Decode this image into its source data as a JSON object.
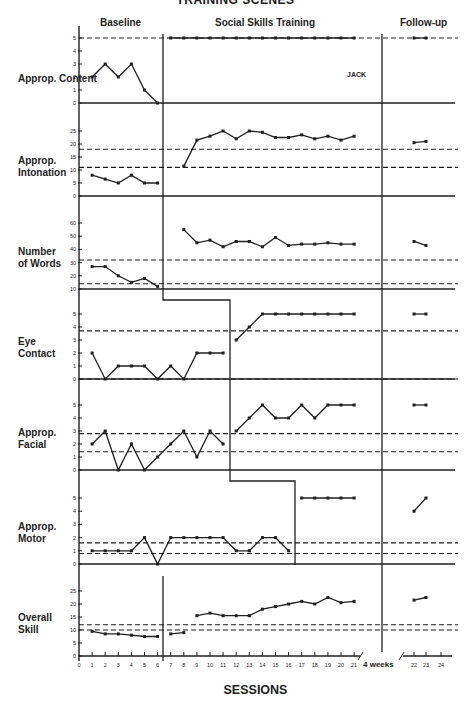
{
  "figure": {
    "title": "TRAINING SCENES",
    "subject": "JACK",
    "phases": [
      "Baseline",
      "Social Skills Training",
      "Follow-up"
    ],
    "x_axis_label": "SESSIONS",
    "gap_label": "4 weeks"
  },
  "chart_data": [
    {
      "type": "line",
      "title": "Approp. Content",
      "ylabel": "Approp. Content",
      "yticks": [
        0,
        1,
        2,
        3,
        4,
        5
      ],
      "ylim": [
        0,
        5
      ],
      "reference_lines": [
        5
      ],
      "phase_change_after_session": 6,
      "series": [
        {
          "name": "Baseline",
          "x": [
            1,
            2,
            3,
            4,
            5,
            6
          ],
          "values": [
            2,
            3,
            2,
            3,
            1,
            0
          ]
        },
        {
          "name": "Training",
          "x": [
            7,
            8,
            9,
            10,
            11,
            12,
            13,
            14,
            15,
            16,
            17,
            18,
            19,
            20,
            21
          ],
          "values": [
            5,
            5,
            5,
            5,
            5,
            5,
            5,
            5,
            5,
            5,
            5,
            5,
            5,
            5,
            5
          ]
        },
        {
          "name": "Follow-up",
          "x": [
            22,
            23
          ],
          "values": [
            5,
            5
          ]
        }
      ]
    },
    {
      "type": "line",
      "title": "Approp. Intonation",
      "ylabel": "Approp. Intonation",
      "yticks": [
        0,
        5,
        10,
        15,
        20,
        25
      ],
      "ylim": [
        0,
        25
      ],
      "reference_lines": [
        11,
        18
      ],
      "phase_change_after_session": 6,
      "series": [
        {
          "name": "Baseline",
          "x": [
            1,
            2,
            3,
            4,
            5,
            6
          ],
          "values": [
            8,
            6.5,
            5,
            8,
            5,
            5
          ]
        },
        {
          "name": "Training",
          "x": [
            8,
            9,
            10,
            11,
            12,
            13,
            14,
            15,
            16,
            17,
            18,
            19,
            20,
            21
          ],
          "values": [
            11.5,
            21.5,
            23,
            25,
            22,
            25,
            24.5,
            22.5,
            22.5,
            23.5,
            22,
            23,
            21.5,
            23
          ]
        },
        {
          "name": "Follow-up",
          "x": [
            22,
            23
          ],
          "values": [
            20.5,
            21
          ]
        }
      ]
    },
    {
      "type": "line",
      "title": "Number of Words",
      "ylabel": "Number of Words",
      "yticks": [
        10,
        20,
        30,
        40,
        50,
        60
      ],
      "ylim": [
        10,
        60
      ],
      "reference_lines": [
        14,
        32
      ],
      "phase_change_after_session": 6,
      "series": [
        {
          "name": "Baseline",
          "x": [
            1,
            2,
            3,
            4,
            5,
            6
          ],
          "values": [
            27,
            27,
            20,
            15,
            18,
            12
          ]
        },
        {
          "name": "Training",
          "x": [
            8,
            9,
            10,
            11,
            12,
            13,
            14,
            15,
            16,
            17,
            18,
            19,
            20,
            21
          ],
          "values": [
            55,
            45,
            47,
            42,
            46,
            46,
            42,
            49,
            43,
            44,
            44,
            45,
            44,
            44
          ]
        },
        {
          "name": "Follow-up",
          "x": [
            22,
            23
          ],
          "values": [
            46,
            43
          ]
        }
      ]
    },
    {
      "type": "line",
      "title": "Eye Contact",
      "ylabel": "Eye Contact",
      "yticks": [
        0,
        1,
        2,
        3,
        4,
        5
      ],
      "ylim": [
        0,
        5
      ],
      "reference_lines": [
        0,
        3.7
      ],
      "phase_change_after_session": 11,
      "series": [
        {
          "name": "Baseline",
          "x": [
            1,
            2,
            3,
            4,
            5,
            6,
            7,
            8,
            9,
            10,
            11
          ],
          "values": [
            2,
            0,
            1,
            1,
            1,
            0,
            1,
            0,
            2,
            2,
            2
          ]
        },
        {
          "name": "Training",
          "x": [
            12,
            13,
            14,
            15,
            16,
            17,
            18,
            19,
            20,
            21
          ],
          "values": [
            3,
            4,
            5,
            5,
            5,
            5,
            5,
            5,
            5,
            5
          ]
        },
        {
          "name": "Follow-up",
          "x": [
            22,
            23
          ],
          "values": [
            5,
            5
          ]
        }
      ]
    },
    {
      "type": "line",
      "title": "Approp. Facial",
      "ylabel": "Approp. Facial",
      "yticks": [
        0,
        1,
        2,
        3,
        4,
        5
      ],
      "ylim": [
        0,
        5
      ],
      "reference_lines": [
        1.4,
        2.8
      ],
      "phase_change_after_session": 11,
      "series": [
        {
          "name": "Baseline",
          "x": [
            1,
            2,
            3,
            4,
            5,
            6,
            7,
            8,
            9,
            10,
            11
          ],
          "values": [
            2,
            3,
            0,
            2,
            0,
            1,
            2,
            3,
            1,
            3,
            2
          ]
        },
        {
          "name": "Training",
          "x": [
            12,
            13,
            14,
            15,
            16,
            17,
            18,
            19,
            20,
            21
          ],
          "values": [
            3,
            4,
            5,
            4,
            4,
            5,
            4,
            5,
            5,
            5
          ]
        },
        {
          "name": "Follow-up",
          "x": [
            22,
            23
          ],
          "values": [
            5,
            5
          ]
        }
      ]
    },
    {
      "type": "line",
      "title": "Approp. Motor",
      "ylabel": "Approp. Motor",
      "yticks": [
        0,
        1,
        2,
        3,
        4,
        5
      ],
      "ylim": [
        0,
        5
      ],
      "reference_lines": [
        0.8,
        1.6
      ],
      "phase_change_after_session": 16,
      "series": [
        {
          "name": "Baseline",
          "x": [
            1,
            2,
            3,
            4,
            5,
            6,
            7,
            8,
            9,
            10,
            11,
            12,
            13,
            14,
            15,
            16
          ],
          "values": [
            1,
            1,
            1,
            1,
            2,
            0,
            2,
            2,
            2,
            2,
            2,
            1,
            1,
            2,
            2,
            1
          ]
        },
        {
          "name": "Training",
          "x": [
            17,
            18,
            19,
            20,
            21
          ],
          "values": [
            5,
            5,
            5,
            5,
            5
          ]
        },
        {
          "name": "Follow-up",
          "x": [
            22,
            23
          ],
          "values": [
            4,
            5
          ]
        }
      ]
    },
    {
      "type": "line",
      "title": "Overall Skill",
      "ylabel": "Overall Skill",
      "yticks": [
        0,
        5,
        10,
        15,
        20,
        25
      ],
      "ylim": [
        0,
        25
      ],
      "reference_lines": [
        10,
        12
      ],
      "phase_change_after_session": 6,
      "series": [
        {
          "name": "Baseline",
          "x": [
            1,
            2,
            3,
            4,
            5,
            6
          ],
          "values": [
            9.5,
            8.5,
            8.5,
            8,
            7.5,
            7.5
          ]
        },
        {
          "name": "Training-a",
          "x": [
            7,
            8
          ],
          "values": [
            8.5,
            9
          ]
        },
        {
          "name": "Training-b",
          "x": [
            9,
            10,
            11,
            12,
            13,
            14,
            15,
            16,
            17,
            18,
            19,
            20,
            21
          ],
          "values": [
            15.5,
            16.5,
            15.5,
            15.5,
            15.5,
            18,
            19,
            20,
            21,
            20,
            22.5,
            20.5,
            21
          ]
        },
        {
          "name": "Follow-up",
          "x": [
            22,
            23
          ],
          "values": [
            21.5,
            22.5
          ]
        }
      ]
    }
  ],
  "x_axis": {
    "ticks": [
      "0",
      "1",
      "2",
      "3",
      "4",
      "5",
      "6",
      "7",
      "8",
      "9",
      "10",
      "11",
      "12",
      "13",
      "14",
      "15",
      "16",
      "17",
      "18",
      "19",
      "20",
      "21",
      "22",
      "23",
      "24"
    ],
    "xlim": [
      0,
      24
    ]
  }
}
